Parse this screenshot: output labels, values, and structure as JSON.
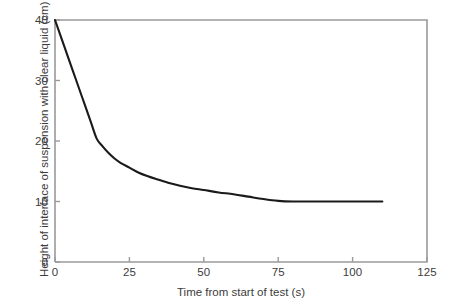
{
  "chart_data": {
    "type": "line",
    "title": "",
    "xlabel": "Time from start of test (s)",
    "ylabel": "Height of interface of suspension with clear liquid (cm)",
    "xlim": [
      0,
      125
    ],
    "ylim": [
      0,
      40
    ],
    "xticks": [
      0,
      25,
      50,
      75,
      100,
      125
    ],
    "xtick_labels": [
      "0",
      "25",
      "50",
      "75",
      "100",
      "125"
    ],
    "yticks": [
      0,
      10,
      20,
      30,
      40
    ],
    "ytick_labels": [
      "0",
      "10",
      "20",
      "30",
      "40"
    ],
    "grid": false,
    "legend": null,
    "series": [
      {
        "name": "Interface height",
        "color": "#1a1a1a",
        "x": [
          0,
          2,
          4,
          6,
          8,
          10,
          12,
          14,
          16,
          18,
          20,
          22,
          25,
          28,
          31,
          34,
          38,
          42,
          46,
          50,
          55,
          60,
          65,
          70,
          75,
          80,
          90,
          100,
          110
        ],
        "y": [
          40.0,
          37.2,
          34.4,
          31.6,
          28.8,
          26.0,
          23.2,
          20.4,
          19.1,
          18.0,
          17.1,
          16.4,
          15.6,
          14.8,
          14.2,
          13.7,
          13.1,
          12.6,
          12.2,
          11.9,
          11.5,
          11.2,
          10.8,
          10.4,
          10.1,
          10.0,
          10.0,
          10.0,
          10.0
        ]
      }
    ],
    "annotations": []
  },
  "axes": {
    "frame_color": "#9a9a9a",
    "curve_color": "#1a1a1a"
  }
}
